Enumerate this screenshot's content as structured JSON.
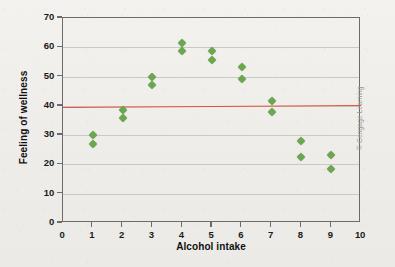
{
  "credit": "© Cengage Learning",
  "colors": {
    "marker": "#6aa84f",
    "trendline": "#e0503c",
    "axis": "#6b6b6b",
    "grid": "#c9c9c9",
    "background": "#f2f0ec"
  },
  "chart_data": {
    "type": "scatter",
    "title": "",
    "xlabel": "Alcohol intake",
    "ylabel": "Feeling of wellness",
    "xlim": [
      0,
      10
    ],
    "ylim": [
      0,
      70
    ],
    "xticks": [
      "0",
      "1",
      "2",
      "3",
      "4",
      "5",
      "6",
      "7",
      "8",
      "9",
      "10"
    ],
    "yticks": [
      "0",
      "10",
      "20",
      "30",
      "40",
      "50",
      "60",
      "70"
    ],
    "grid": "horizontal",
    "legend": "none",
    "points": [
      {
        "x": 1,
        "y": 30.0
      },
      {
        "x": 1,
        "y": 27.0
      },
      {
        "x": 2,
        "y": 38.5
      },
      {
        "x": 2,
        "y": 35.8
      },
      {
        "x": 3,
        "y": 50.0
      },
      {
        "x": 3,
        "y": 47.0
      },
      {
        "x": 4,
        "y": 61.5
      },
      {
        "x": 4,
        "y": 58.6
      },
      {
        "x": 5,
        "y": 58.6
      },
      {
        "x": 5,
        "y": 55.6
      },
      {
        "x": 6,
        "y": 53.2
      },
      {
        "x": 6,
        "y": 49.3
      },
      {
        "x": 7,
        "y": 41.6
      },
      {
        "x": 7,
        "y": 38.0
      },
      {
        "x": 8,
        "y": 28.0
      },
      {
        "x": 8,
        "y": 22.5
      },
      {
        "x": 9,
        "y": 23.2
      },
      {
        "x": 9,
        "y": 18.3
      }
    ],
    "trendline": {
      "label": "regression line",
      "x_start": 0,
      "y_start": 39.7,
      "x_end": 10,
      "y_end": 40.4
    }
  }
}
